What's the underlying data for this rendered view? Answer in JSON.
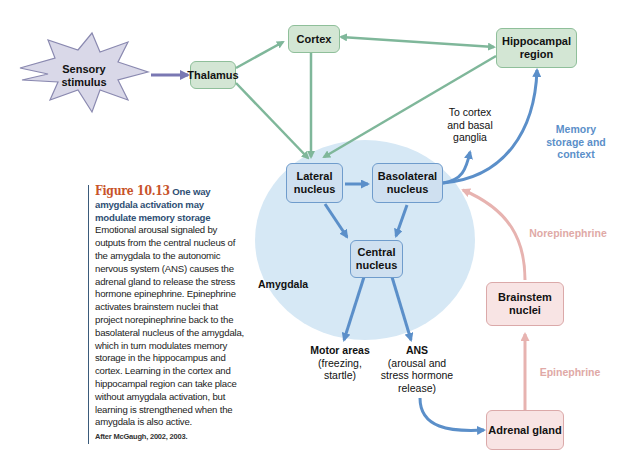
{
  "figure": {
    "number": "Figure 10.13",
    "title": "One way amygdala activation may modulate memory storage",
    "caption": "Emotional arousal signaled by outputs from the central nucleus of the amygdala to the autonomic nervous system (ANS) causes the adrenal gland to release the stress hormone epinephrine. Epinephrine activates brainstem nuclei that project norepinephrine back to the basolateral nucleus of the amygdala, which in turn modulates memory storage in the hippocampus and cortex. Learning in the cortex and hippocampal region can take place without amygdala activation, but learning is strengthened when the amygdala is also active.",
    "credit": "After McGaugh, 2002, 2003."
  },
  "nodes": {
    "sensory": "Sensory stimulus",
    "thalamus": "Thalamus",
    "cortex": "Cortex",
    "hippocampal": "Hippocampal region",
    "lateral": "Lateral nucleus",
    "basolateral": "Basolateral nucleus",
    "central": "Central nucleus",
    "brainstem": "Brainstem nuclei",
    "adrenal": "Adrenal gland"
  },
  "labels": {
    "amygdala": "Amygdala",
    "to_cortex": "To cortex and basal ganglia",
    "memory": "Memory storage and context",
    "norepinephrine": "Norepinephrine",
    "epinephrine": "Epinephrine",
    "motor_title": "Motor areas",
    "motor_sub": "(freezing, startle)",
    "ans_title": "ANS",
    "ans_sub": "(arousal and stress hormone release)"
  },
  "colors": {
    "green_arrow": "#7fb79a",
    "blue_arrow": "#5b8fc9",
    "pink_arrow": "#e7b3b0",
    "purple_arrow": "#7a78b3",
    "amygdala_fill": "#d6e8f5",
    "memory_text": "#5b8fc9",
    "pink_text": "#e0a9a6"
  }
}
